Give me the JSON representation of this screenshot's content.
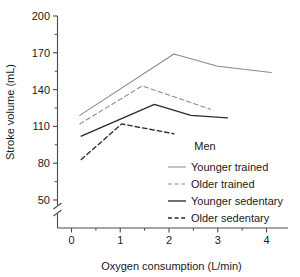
{
  "chart_data": {
    "type": "line",
    "title": "",
    "xlabel": "Oxygen consumption (L/min)",
    "ylabel": "Stroke volume (mL)",
    "xlim": [
      -0.22,
      4.45
    ],
    "ylim": [
      38,
      200
    ],
    "y_break": true,
    "grid": false,
    "xticks": [
      0,
      1,
      2,
      3,
      4
    ],
    "xtick_labels": [
      "0",
      "1",
      "2",
      "3",
      "4"
    ],
    "x_minor_ticks": [
      0.5,
      1.5,
      2.5,
      3.5
    ],
    "yticks": [
      50,
      80,
      110,
      140,
      170,
      200
    ],
    "ytick_labels": [
      "50",
      "80",
      "110",
      "140",
      "170",
      "200"
    ],
    "y_minor_ticks": [
      65,
      95,
      125,
      155,
      185
    ],
    "legend_position": "inside-right",
    "legend_title": "Men",
    "series": [
      {
        "name": "Younger trained",
        "style": "solid",
        "color": "#8a8a8a",
        "x": [
          0.17,
          2.1,
          3.0,
          4.1
        ],
        "y": [
          119,
          169,
          159,
          154
        ]
      },
      {
        "name": "Older trained",
        "style": "dashed",
        "color": "#8a8a8a",
        "x": [
          0.17,
          1.45,
          2.85
        ],
        "y": [
          112,
          143,
          124
        ]
      },
      {
        "name": "Younger sedentary",
        "style": "solid",
        "color": "#2b2b2b",
        "x": [
          0.2,
          1.7,
          2.45,
          3.2
        ],
        "y": [
          102,
          128,
          119,
          117
        ]
      },
      {
        "name": "Older sedentary",
        "style": "dashed",
        "color": "#2b2b2b",
        "x": [
          0.2,
          1.03,
          2.1
        ],
        "y": [
          83,
          112,
          104
        ]
      }
    ]
  },
  "axes": {
    "ylabel": "Stroke volume (mL)",
    "xlabel": "Oxygen consumption (L/min)"
  },
  "legend": {
    "title": "Men",
    "items": [
      {
        "label": "Younger trained"
      },
      {
        "label": "Older trained"
      },
      {
        "label": "Younger sedentary"
      },
      {
        "label": "Older sedentary"
      }
    ]
  }
}
